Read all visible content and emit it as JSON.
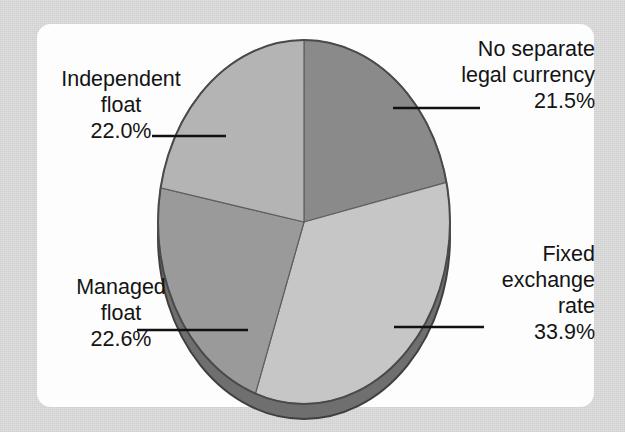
{
  "chart_data": {
    "type": "pie",
    "title": "",
    "subtitle": "",
    "xlabel": "",
    "ylabel": "",
    "legend_position": "none",
    "grid": false,
    "style": "3d-pie",
    "start_angle_deg": 0,
    "direction": "clockwise",
    "categories": [
      "No separate legal currency",
      "Fixed exchange rate",
      "Managed float",
      "Independent float"
    ],
    "values": [
      21.5,
      33.9,
      22.6,
      22.0
    ],
    "value_labels": [
      "21.5%",
      "33.9%",
      "22.6%",
      "22.0%"
    ],
    "colors": [
      "#8a8a8a",
      "#c6c6c6",
      "#9a9a9a",
      "#b4b4b4"
    ],
    "slices": [
      {
        "name": "No separate legal currency",
        "label_lines": [
          "No separate",
          "legal currency"
        ],
        "value": 21.5,
        "value_label": "21.5%",
        "color": "#8a8a8a",
        "position": "top-right"
      },
      {
        "name": "Fixed exchange rate",
        "label_lines": [
          "Fixed",
          "exchange",
          "rate"
        ],
        "value": 33.9,
        "value_label": "33.9%",
        "color": "#c6c6c6",
        "position": "bottom-right"
      },
      {
        "name": "Managed float",
        "label_lines": [
          "Managed",
          "float"
        ],
        "value": 22.6,
        "value_label": "22.6%",
        "color": "#9a9a9a",
        "position": "bottom-left"
      },
      {
        "name": "Independent float",
        "label_lines": [
          "Independent",
          "float"
        ],
        "value": 22.0,
        "value_label": "22.0%",
        "color": "#b4b4b4",
        "position": "top-left"
      }
    ]
  },
  "labels": {
    "top_right": {
      "line1": "No separate",
      "line2": "legal currency",
      "value": "21.5%"
    },
    "top_left": {
      "line1": "Independent",
      "line2": "float",
      "value": "22.0%"
    },
    "bottom_left": {
      "line1": "Managed",
      "line2": "float",
      "value": "22.6%"
    },
    "bottom_right": {
      "line1": "Fixed",
      "line2": "exchange",
      "line3": "rate",
      "value": "33.9%"
    }
  },
  "theme": {
    "page_background": "#dedede",
    "panel_background": "#fdfdfd",
    "text_color": "#141414",
    "leader_line_color": "#111111",
    "pie_outline_color": "#4a4a4a",
    "pie_side_color": "#6f6f6f"
  }
}
